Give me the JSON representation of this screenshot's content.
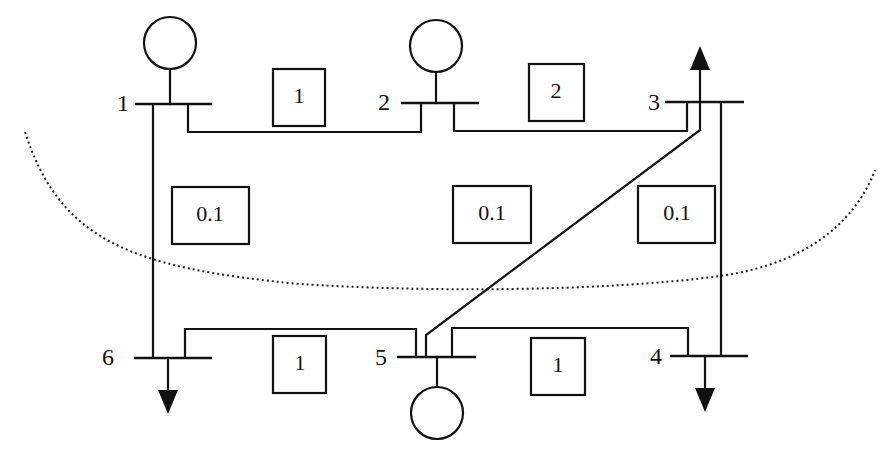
{
  "diagram": {
    "type": "six-bus power system network with cut-set boundary",
    "buses": [
      {
        "id": "1",
        "label": "1",
        "attached": "generator"
      },
      {
        "id": "2",
        "label": "2",
        "attached": "generator"
      },
      {
        "id": "3",
        "label": "3",
        "attached": "load-arrow-up"
      },
      {
        "id": "4",
        "label": "4",
        "attached": "load-arrow-down"
      },
      {
        "id": "5",
        "label": "5",
        "attached": "generator"
      },
      {
        "id": "6",
        "label": "6",
        "attached": "load-arrow-down"
      }
    ],
    "lines": [
      {
        "from": "1",
        "to": "2",
        "value": "1"
      },
      {
        "from": "2",
        "to": "3",
        "value": "2"
      },
      {
        "from": "1",
        "to": "6",
        "value": "0.1"
      },
      {
        "from": "3",
        "to": "5",
        "value": "0.1"
      },
      {
        "from": "3",
        "to": "4",
        "value": "0.1"
      },
      {
        "from": "6",
        "to": "5",
        "value": "1"
      },
      {
        "from": "5",
        "to": "4",
        "value": "1"
      }
    ],
    "cut_boundary": "dotted curve"
  }
}
